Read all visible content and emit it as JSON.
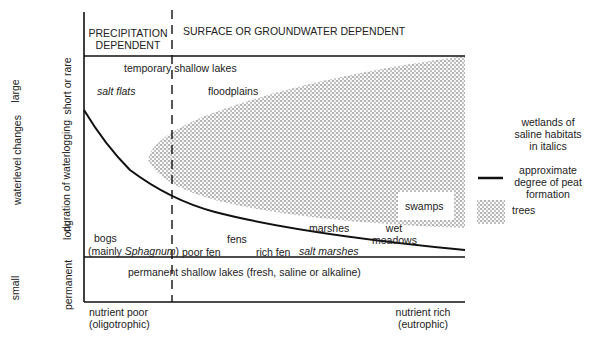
{
  "header": {
    "precipitation_line1": "PRECIPITATION",
    "precipitation_line2": "DEPENDENT",
    "surface": "SURFACE OR GROUNDWATER DEPENDENT"
  },
  "y_axes": {
    "outer_label": "waterlevel changes",
    "outer_top": "large",
    "outer_bottom": "small",
    "inner_label": "duration of waterlogging",
    "inner_top": "short or rare",
    "inner_mid": "long",
    "inner_bottom": "permanent"
  },
  "x_axis": {
    "left_line1": "nutrient poor",
    "left_line2": "(oligotrophic)",
    "right_line1": "nutrient rich",
    "right_line2": "(eutrophic)"
  },
  "regions": {
    "temporary_lakes": "temporary shallow lakes",
    "salt_flats": "salt flats",
    "floodplains": "floodplains",
    "swamps": "swamps",
    "bogs_line1": "bogs",
    "bogs_line2_a": "(mainly ",
    "bogs_line2_b": "Sphagnum",
    "bogs_line2_c": ")",
    "poor_fen": "poor fen",
    "fens": "fens",
    "rich_fen": "rich fen",
    "salt_marshes": "salt marshes",
    "marshes": "marshes",
    "wet_meadows_1": "wet",
    "wet_meadows_2": "meadows",
    "permanent_lakes": "permanent shallow lakes (fresh, saline or alkaline)"
  },
  "legend": {
    "italics_note_1": "wetlands of",
    "italics_note_2": "saline habitats",
    "italics_note_3": "in italics",
    "peat_1": "approximate",
    "peat_2": "degree of peat",
    "peat_3": "formation",
    "trees": "trees"
  },
  "colors": {
    "line": "#111111",
    "stipple": "#555555"
  }
}
